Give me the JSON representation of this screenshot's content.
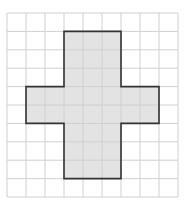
{
  "diagram": {
    "type": "grid-shape",
    "grid": {
      "columns": 9,
      "rows": 10,
      "origin_x": 7,
      "origin_y": 13,
      "cell_w": 19,
      "cell_h": 18.4,
      "line_color": "#d0d0d0"
    },
    "shape": {
      "name": "cross",
      "fill": "#e3e3e3",
      "stroke": "#333333",
      "cells_rects": [
        {
          "col": 3,
          "row": 1,
          "w": 3,
          "h": 8
        },
        {
          "col": 1,
          "row": 4,
          "w": 7,
          "h": 2
        }
      ],
      "outline_cells": [
        [
          3,
          1
        ],
        [
          6,
          1
        ],
        [
          6,
          4
        ],
        [
          8,
          4
        ],
        [
          8,
          6
        ],
        [
          6,
          6
        ],
        [
          6,
          9
        ],
        [
          3,
          9
        ],
        [
          3,
          6
        ],
        [
          1,
          6
        ],
        [
          1,
          4
        ],
        [
          3,
          4
        ]
      ]
    }
  }
}
